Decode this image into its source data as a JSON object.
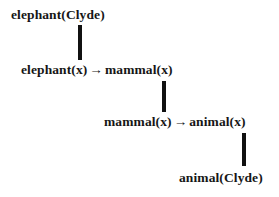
{
  "diagram": {
    "background_color": "#ffffff",
    "text_color": "#161616",
    "connector_color": "#111111",
    "arrow_symbol": "→",
    "nodes": [
      {
        "id": "premise-elephant-clyde",
        "text": "elephant(Clyde)",
        "left": "elephant(Clyde)",
        "arrow": "",
        "right": ""
      },
      {
        "id": "rule-elephant-mammal",
        "text": "elephant(x) → mammal(x)",
        "left": "elephant(x)",
        "arrow": "→",
        "right": "mammal(x)"
      },
      {
        "id": "rule-mammal-animal",
        "text": "mammal(x) → animal(x)",
        "left": "mammal(x)",
        "arrow": "→",
        "right": "animal(x)"
      },
      {
        "id": "conclusion-animal-clyde",
        "text": "animal(Clyde)",
        "left": "animal(Clyde)",
        "arrow": "",
        "right": ""
      }
    ],
    "connectors": [
      {
        "id": "connector-1",
        "from": "premise-elephant-clyde",
        "to": "rule-elephant-mammal"
      },
      {
        "id": "connector-2",
        "from": "rule-elephant-mammal",
        "to": "rule-mammal-animal"
      },
      {
        "id": "connector-3",
        "from": "rule-mammal-animal",
        "to": "conclusion-animal-clyde"
      }
    ]
  }
}
